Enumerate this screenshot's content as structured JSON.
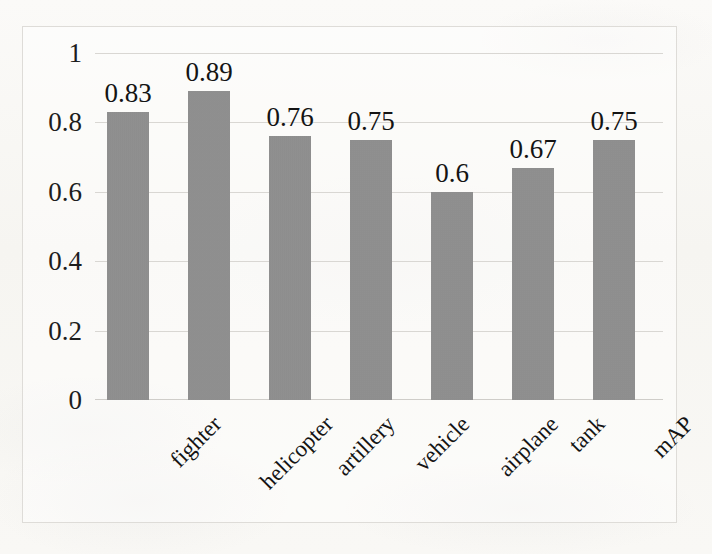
{
  "chart_data": {
    "type": "bar",
    "title": "",
    "xlabel": "",
    "ylabel": "",
    "categories": [
      "fighter",
      "helicopter",
      "artillery",
      "vehicle",
      "airplane",
      "tank",
      "mAP"
    ],
    "values": [
      0.83,
      0.89,
      0.76,
      0.75,
      0.6,
      0.67,
      0.75
    ],
    "value_labels": [
      "0.83",
      "0.89",
      "0.76",
      "0.75",
      "0.6",
      "0.67",
      "0.75"
    ],
    "ylim": [
      0,
      1
    ],
    "ytick_values": [
      0,
      0.2,
      0.4,
      0.6,
      0.8,
      1
    ],
    "ytick_labels": [
      "0",
      "0.2",
      "0.4",
      "0.6",
      "0.8",
      "1"
    ],
    "grid": true,
    "legend": "none",
    "bar_color": "#8f8f8f",
    "background_color": "#f8f7f4",
    "gridline_color": "#d9d7d3",
    "text_color": "#141414"
  }
}
